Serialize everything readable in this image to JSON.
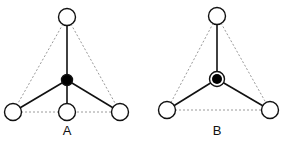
{
  "figures": [
    {
      "label": "A",
      "description": "tetrahedral-like arrangement with central filled atom and three base atoms plus one front atom",
      "center": {
        "x": 67,
        "y": 80,
        "type": "filled"
      },
      "nodes": [
        {
          "x": 67,
          "y": 17
        },
        {
          "x": 13,
          "y": 112
        },
        {
          "x": 67,
          "y": 112
        },
        {
          "x": 120,
          "y": 112
        }
      ],
      "dashed_edges": [
        [
          0,
          1
        ],
        [
          0,
          3
        ],
        [
          1,
          2
        ],
        [
          2,
          3
        ]
      ],
      "label_pos": {
        "x": 67,
        "y": 124
      }
    },
    {
      "label": "B",
      "description": "trigonal arrangement with central ringed filled atom and three outer atoms",
      "center": {
        "x": 217,
        "y": 79,
        "type": "ringed"
      },
      "nodes": [
        {
          "x": 217,
          "y": 16
        },
        {
          "x": 167,
          "y": 110
        },
        {
          "x": 270,
          "y": 110
        }
      ],
      "dashed_edges": [
        [
          0,
          1
        ],
        [
          0,
          2
        ],
        [
          1,
          2
        ]
      ],
      "label_pos": {
        "x": 217,
        "y": 124
      }
    }
  ],
  "colors": {
    "stroke": "#111111",
    "dashed": "#9a9a9a",
    "fill": "#ffffff"
  }
}
